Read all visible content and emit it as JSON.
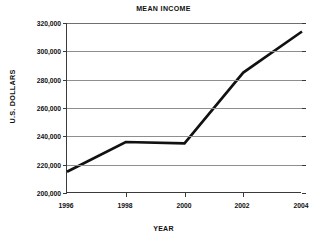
{
  "chart_data": {
    "type": "line",
    "title": "MEAN INCOME",
    "xlabel": "YEAR",
    "ylabel": "U.S. DOLLARS",
    "x": [
      1996,
      1998,
      2000,
      2002,
      2004
    ],
    "xtick_labels": [
      "1996",
      "1998",
      "2000",
      "2002",
      "2004"
    ],
    "ytick_labels": [
      "320,000",
      "300,000",
      "280,000",
      "260,000",
      "240,000",
      "220,000",
      "200,000"
    ],
    "ytick_values": [
      320000,
      300000,
      280000,
      260000,
      240000,
      220000,
      200000
    ],
    "ylim": [
      200000,
      320000
    ],
    "xlim": [
      1996,
      2004
    ],
    "grid": true,
    "legend": false,
    "series": [
      {
        "name": "Mean income",
        "color": "#111111",
        "values": [
          215000,
          236000,
          235000,
          285000,
          314000
        ]
      }
    ]
  },
  "colors": {
    "line": "#111111",
    "grid": "#8e8e8e",
    "axis": "#3a3a3a",
    "background": "#ffffff",
    "text": "#111111"
  }
}
